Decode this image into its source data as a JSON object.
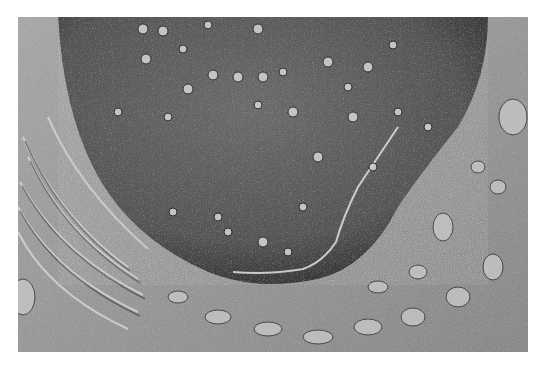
{
  "image": {
    "description": "Freeze-fracture electron micrograph showing a large nucleus with dispersed nuclear pores on its fractured envelope, surrounded by cytoplasm with stacked membranes and vesicles",
    "tone": "grayscale",
    "colors": {
      "background": "#ffffff",
      "nucleus_surface": "#5a5a5a",
      "nucleus_dark_edge": "#2e2e2e",
      "cytoplasm": "#9a9a9a",
      "highlight": "#e6e6e6"
    }
  }
}
